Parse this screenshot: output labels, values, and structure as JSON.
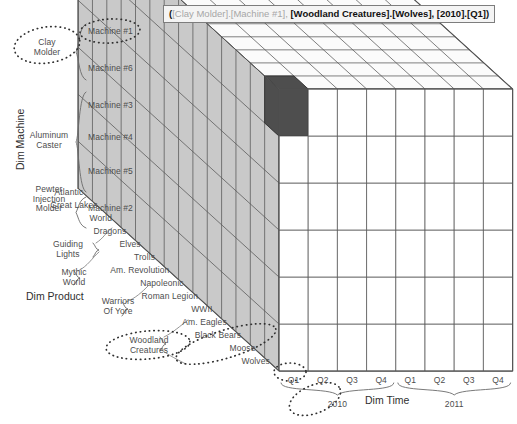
{
  "tooltip": {
    "name": "cell-tooltip",
    "full_text": "([Clay Molder].[Machine #1], [Woodland Creatures].[Wolves], [2010].[Q1])",
    "open_paren": "(",
    "part_machine_parent": "[Clay Molder].",
    "part_machine_member": "[Machine #1], ",
    "part_product_parent": "[Woodland Creatures].",
    "part_product_member": "[Wolves], ",
    "part_time_parent": "[2010].",
    "part_time_member": "[Q1]",
    "close_paren": ")"
  },
  "dimensions": {
    "machine_title": "Dim Machine",
    "product_title": "Dim Product",
    "time_title": "Dim Time"
  },
  "machine": {
    "members": [
      "Machine #1",
      "Machine #6",
      "Machine #3",
      "Machine #4",
      "Machine #5",
      "Machine #2"
    ],
    "groups": [
      {
        "label_line1": "Clay",
        "label_line2": "Molder",
        "label_line3": "",
        "span": 2
      },
      {
        "label_line1": "Aluminum",
        "label_line2": "Caster",
        "label_line3": "",
        "span": 3
      },
      {
        "label_line1": "Pewter",
        "label_line2": "Injection",
        "label_line3": "Molder",
        "span": 1
      }
    ]
  },
  "product": {
    "members": [
      "Atlantic",
      "Great Lakes",
      "World",
      "Dragons",
      "Elves",
      "Trolls",
      "Am. Revolution",
      "Napoleonic",
      "Roman Legion",
      "WWII",
      "Am. Eagles",
      "Black Bears",
      "Moose",
      "Wolves"
    ],
    "groups": [
      {
        "label_line1": "Guiding",
        "label_line2": "Lights",
        "span": 3
      },
      {
        "label_line1": "Mythic",
        "label_line2": "World",
        "span": 3
      },
      {
        "label_line1": "Warriors",
        "label_line2": "Of Yore",
        "span": 4
      },
      {
        "label_line1": "Woodland",
        "label_line2": "Creatures",
        "span": 4
      }
    ]
  },
  "time": {
    "quarters": [
      "Q1",
      "Q2",
      "Q3",
      "Q4",
      "Q1",
      "Q2",
      "Q3",
      "Q4"
    ],
    "years": [
      {
        "label": "2010",
        "span": 4
      },
      {
        "label": "2011",
        "span": 4
      }
    ]
  },
  "highlight": {
    "machine": "Machine #1",
    "product": "Wolves",
    "quarter": "Q1",
    "year": "2010",
    "color": "#4e4e4e"
  },
  "colors": {
    "front_face": "#ffffff",
    "left_face": "#c9c9c9",
    "top_face": "#fbfbfb",
    "grid_line": "#555555",
    "selection": "#4e4e4e",
    "label_text": "#4d4d4d",
    "tooltip_bg": "#f4f4f4",
    "tooltip_border": "#7d7d7d"
  }
}
